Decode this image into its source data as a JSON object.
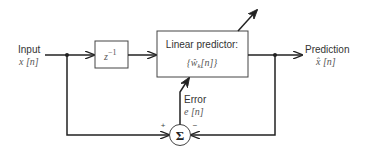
{
  "diagram": {
    "type": "block-diagram",
    "input": {
      "label": "Input",
      "signal": "x [n]"
    },
    "delay_block": {
      "label": "z",
      "exponent": "−1"
    },
    "predictor_block": {
      "label": "Linear predictor:",
      "params": "{ŵ",
      "params_sub": "k",
      "params_end": "[n]}"
    },
    "output": {
      "label": "Prediction",
      "signal": "x̂ [n]"
    },
    "error": {
      "label": "Error",
      "signal": "e [n]"
    },
    "summer": {
      "symbol": "Σ",
      "plus": "+",
      "minus": "−"
    },
    "colors": {
      "line": "#222222",
      "text": "#333333",
      "background": "#ffffff"
    }
  }
}
